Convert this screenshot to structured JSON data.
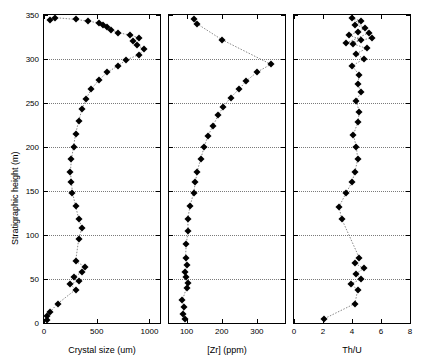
{
  "chart_data": [
    {
      "type": "scatter",
      "title": "",
      "xlabel": "Crystal size (um)",
      "ylabel": "Stratigraphic height (m)",
      "xlim": [
        0,
        1100
      ],
      "ylim": [
        0,
        350
      ],
      "xticks": [
        0,
        500,
        1000
      ],
      "xticklabels": [
        "0",
        "500",
        "1000"
      ],
      "yticks": [
        0,
        50,
        100,
        150,
        200,
        250,
        300,
        350
      ],
      "yticklabels": [
        "0",
        "50",
        "100",
        "150",
        "200",
        "250",
        "300",
        "350"
      ],
      "grid": true,
      "connected": true,
      "marker": "filled-diamond",
      "points": [
        [
          30,
          3
        ],
        [
          25,
          8
        ],
        [
          60,
          13
        ],
        [
          130,
          22
        ],
        [
          300,
          38
        ],
        [
          250,
          44
        ],
        [
          330,
          48
        ],
        [
          280,
          52
        ],
        [
          360,
          58
        ],
        [
          390,
          64
        ],
        [
          300,
          70
        ],
        [
          330,
          96
        ],
        [
          360,
          108
        ],
        [
          330,
          118
        ],
        [
          300,
          133
        ],
        [
          270,
          148
        ],
        [
          260,
          160
        ],
        [
          250,
          172
        ],
        [
          260,
          186
        ],
        [
          280,
          200
        ],
        [
          300,
          215
        ],
        [
          330,
          230
        ],
        [
          360,
          243
        ],
        [
          400,
          255
        ],
        [
          450,
          266
        ],
        [
          520,
          276
        ],
        [
          600,
          285
        ],
        [
          700,
          292
        ],
        [
          780,
          299
        ],
        [
          900,
          305
        ],
        [
          950,
          311
        ],
        [
          880,
          316
        ],
        [
          840,
          320
        ],
        [
          900,
          324
        ],
        [
          820,
          327
        ],
        [
          700,
          330
        ],
        [
          640,
          333
        ],
        [
          600,
          336
        ],
        [
          560,
          339
        ],
        [
          520,
          341
        ],
        [
          420,
          343
        ],
        [
          300,
          345
        ],
        [
          100,
          347
        ],
        [
          60,
          344
        ]
      ]
    },
    {
      "type": "scatter",
      "title": "",
      "xlabel": "[Zr] (ppm)",
      "ylabel": "",
      "xlim": [
        50,
        380
      ],
      "ylim": [
        0,
        350
      ],
      "xticks": [
        100,
        200,
        300
      ],
      "xticklabels": [
        "100",
        "200",
        "300"
      ],
      "yticks": [
        0,
        50,
        100,
        150,
        200,
        250,
        300,
        350
      ],
      "grid": true,
      "connected": true,
      "marker": "filled-diamond",
      "points": [
        [
          95,
          4
        ],
        [
          90,
          10
        ],
        [
          92,
          18
        ],
        [
          88,
          26
        ],
        [
          100,
          40
        ],
        [
          103,
          46
        ],
        [
          98,
          52
        ],
        [
          96,
          58
        ],
        [
          100,
          66
        ],
        [
          97,
          74
        ],
        [
          99,
          90
        ],
        [
          105,
          105
        ],
        [
          103,
          118
        ],
        [
          110,
          133
        ],
        [
          120,
          148
        ],
        [
          125,
          160
        ],
        [
          130,
          172
        ],
        [
          140,
          186
        ],
        [
          150,
          200
        ],
        [
          160,
          212
        ],
        [
          175,
          224
        ],
        [
          190,
          236
        ],
        [
          205,
          246
        ],
        [
          225,
          256
        ],
        [
          250,
          266
        ],
        [
          270,
          275
        ],
        [
          300,
          285
        ],
        [
          340,
          294
        ],
        [
          200,
          322
        ],
        [
          130,
          340
        ],
        [
          120,
          345
        ]
      ]
    },
    {
      "type": "scatter",
      "title": "",
      "xlabel": "Th/U",
      "ylabel": "",
      "xlim": [
        0,
        8
      ],
      "ylim": [
        0,
        350
      ],
      "xticks": [
        0,
        2,
        4,
        6,
        8
      ],
      "xticklabels": [
        "0",
        "2",
        "4",
        "6",
        "8"
      ],
      "yticks": [
        0,
        50,
        100,
        150,
        200,
        250,
        300,
        350
      ],
      "grid": true,
      "connected": true,
      "marker": "filled-diamond",
      "points": [
        [
          2.1,
          5
        ],
        [
          4.2,
          22
        ],
        [
          4.4,
          38
        ],
        [
          3.9,
          44
        ],
        [
          4.6,
          50
        ],
        [
          4.3,
          56
        ],
        [
          4.8,
          62
        ],
        [
          4.2,
          68
        ],
        [
          4.5,
          74
        ],
        [
          3.3,
          118
        ],
        [
          3.1,
          132
        ],
        [
          3.6,
          148
        ],
        [
          4.0,
          160
        ],
        [
          4.2,
          172
        ],
        [
          4.4,
          186
        ],
        [
          4.3,
          200
        ],
        [
          4.1,
          214
        ],
        [
          4.4,
          228
        ],
        [
          4.5,
          240
        ],
        [
          4.3,
          252
        ],
        [
          4.6,
          262
        ],
        [
          4.4,
          272
        ],
        [
          4.5,
          282
        ],
        [
          4.0,
          292
        ],
        [
          4.8,
          300
        ],
        [
          4.3,
          306
        ],
        [
          5.0,
          312
        ],
        [
          4.1,
          317
        ],
        [
          4.6,
          322
        ],
        [
          3.8,
          327
        ],
        [
          4.4,
          331
        ],
        [
          4.9,
          335
        ],
        [
          4.2,
          339
        ],
        [
          4.6,
          343
        ],
        [
          4.0,
          347
        ],
        [
          5.2,
          330
        ],
        [
          3.6,
          318
        ],
        [
          5.4,
          324
        ]
      ]
    }
  ],
  "axes": {
    "y_title": "Stratigraphic height (m)",
    "panel1_xtitle": "Crystal size (um)",
    "panel2_xtitle": "[Zr] (ppm)",
    "panel3_xtitle": "Th/U"
  }
}
